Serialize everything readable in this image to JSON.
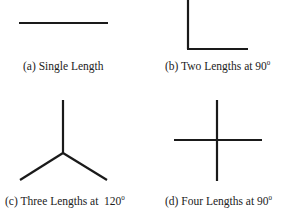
{
  "figure": {
    "panels": [
      {
        "id": "a",
        "label": "(a)",
        "caption": "Single Length",
        "angle_sup": "",
        "description": "single horizontal line segment"
      },
      {
        "id": "b",
        "label": "(b)",
        "caption": "Two Lengths at 90",
        "angle_sup": "0",
        "description": "two segments meeting at a right angle (L shape)"
      },
      {
        "id": "c",
        "label": "(c)",
        "caption": "Three Lengths at  120",
        "angle_sup": "0",
        "description": "three segments meeting at 120 degrees (Y shape)"
      },
      {
        "id": "d",
        "label": "(d)",
        "caption": "Four Lengths at 90",
        "angle_sup": "0",
        "description": "four segments meeting at 90 degrees (cross shape)"
      }
    ],
    "line_color": "#1a1a1a",
    "line_width": 2.2
  }
}
